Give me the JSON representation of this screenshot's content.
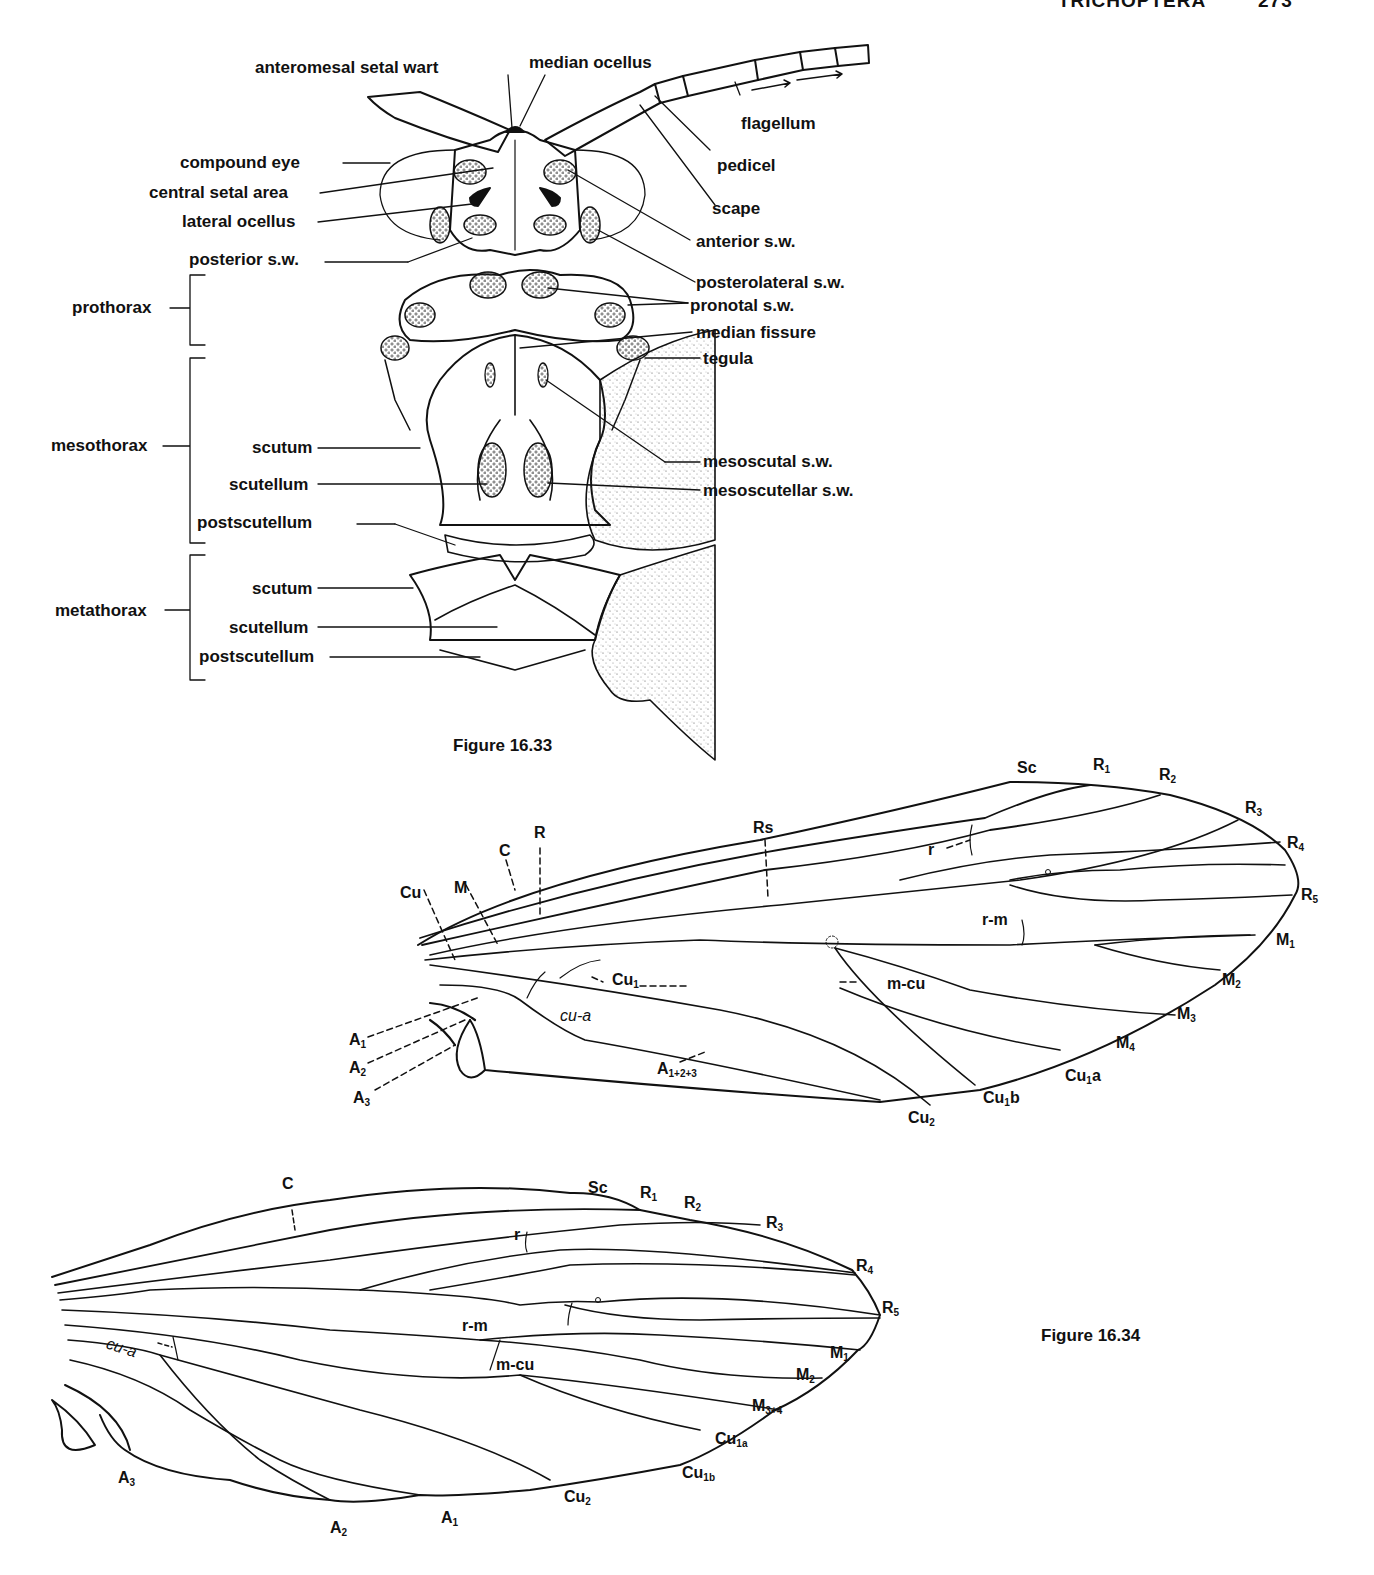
{
  "header": {
    "title": "TRICHOPTERA",
    "page_number": "273"
  },
  "figure_16_33": {
    "caption": "Figure 16.33",
    "head_labels": {
      "anteromesal_setal_wart": "anteromesal setal wart",
      "median_ocellus": "median ocellus",
      "flagellum": "flagellum",
      "pedicel": "pedicel",
      "scape": "scape",
      "compound_eye": "compound eye",
      "central_setal_area": "central setal area",
      "lateral_ocellus": "lateral ocellus",
      "anterior_sw": "anterior s.w.",
      "posterior_sw": "posterior s.w.",
      "posterolateral_sw": "posterolateral s.w."
    },
    "thorax_labels": {
      "prothorax": "prothorax",
      "pronotal_sw": "pronotal s.w.",
      "median_fissure": "median fissure",
      "tegula": "tegula",
      "mesothorax": "mesothorax",
      "meso_scutum": "scutum",
      "meso_scutellum": "scutellum",
      "meso_postscutellum": "postscutellum",
      "mesoscutal_sw": "mesoscutal s.w.",
      "mesoscutellar_sw": "mesoscutellar s.w.",
      "metathorax": "metathorax",
      "meta_scutum": "scutum",
      "meta_scutellum": "scutellum",
      "meta_postscutellum": "postscutellum"
    },
    "forewing_labels": {
      "Sc": "Sc",
      "R1": "R",
      "R1_sub": "1",
      "R2": "R",
      "R2_sub": "2",
      "R3": "R",
      "R3_sub": "3",
      "R4": "R",
      "R4_sub": "4",
      "R5": "R",
      "R5_sub": "5",
      "Rs": "Rs",
      "R": "R",
      "C": "C",
      "M": "M",
      "Cu": "Cu",
      "r": "r",
      "rm": "r-m",
      "M1": "M",
      "M1_sub": "1",
      "M2": "M",
      "M2_sub": "2",
      "M3": "M",
      "M3_sub": "3",
      "M4": "M",
      "M4_sub": "4",
      "Cu1": "Cu",
      "Cu1_sub": "1",
      "mcu": "m-cu",
      "cua": "cu-a",
      "Cu1a": "Cu",
      "Cu1a_sub": "1",
      "Cu1a_suffix": "a",
      "Cu1b": "Cu",
      "Cu1b_sub": "1",
      "Cu1b_suffix": "b",
      "Cu2": "Cu",
      "Cu2_sub": "2",
      "A1": "A",
      "A1_sub": "1",
      "A2": "A",
      "A2_sub": "2",
      "A3": "A",
      "A3_sub": "3",
      "A123": "A",
      "A123_sub": "1+2+3"
    }
  },
  "figure_16_34": {
    "caption": "Figure 16.34",
    "hindwing_labels": {
      "C": "C",
      "Sc": "Sc",
      "R1": "R",
      "R1_sub": "1",
      "R2": "R",
      "R2_sub": "2",
      "R3": "R",
      "R3_sub": "3",
      "R4": "R",
      "R4_sub": "4",
      "R5": "R",
      "R5_sub": "5",
      "r": "r",
      "rm": "r-m",
      "mcu": "m-cu",
      "cua": "cu-a",
      "M1": "M",
      "M1_sub": "1",
      "M2": "M",
      "M2_sub": "2",
      "M34": "M",
      "M34_sub": "3+4",
      "Cu1a": "Cu",
      "Cu1a_sub": "1a",
      "Cu1b": "Cu",
      "Cu1b_sub": "1b",
      "Cu2": "Cu",
      "Cu2_sub": "2",
      "A1": "A",
      "A1_sub": "1",
      "A2": "A",
      "A2_sub": "2",
      "A3": "A",
      "A3_sub": "3"
    }
  }
}
